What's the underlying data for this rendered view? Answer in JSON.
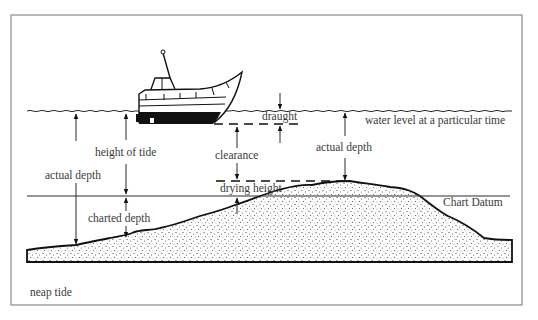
{
  "figure": {
    "caption": "neap tide",
    "labels": {
      "draught": "draught",
      "water_level": "water level at a particular time",
      "height_of_tide": "height of tide",
      "clearance": "clearance",
      "actual_depth_left": "actual depth",
      "actual_depth_right": "actual depth",
      "drying_height": "drying height",
      "chart_datum": "Chart Datum",
      "charted_depth": "charted depth"
    },
    "colors": {
      "ink": "#111111",
      "text": "#3a3a3a",
      "frame": "#8a8a8a",
      "background": "#ffffff"
    }
  }
}
